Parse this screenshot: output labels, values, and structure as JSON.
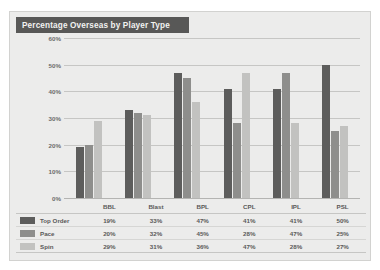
{
  "chart_data": {
    "type": "bar",
    "title": "Percentage Overseas by Player Type",
    "categories": [
      "BBL",
      "Blast",
      "BPL",
      "CPL",
      "IPL",
      "PSL"
    ],
    "series": [
      {
        "name": "Top Order",
        "values": [
          19,
          33,
          47,
          41,
          41,
          50
        ],
        "color": "#5d5d5c",
        "labels": [
          "19%",
          "33%",
          "47%",
          "41%",
          "41%",
          "50%"
        ]
      },
      {
        "name": "Pace",
        "values": [
          20,
          32,
          45,
          28,
          47,
          25
        ],
        "color": "#8e8e8c",
        "labels": [
          "20%",
          "32%",
          "45%",
          "28%",
          "47%",
          "25%"
        ]
      },
      {
        "name": "Spin",
        "values": [
          29,
          31,
          36,
          47,
          28,
          27
        ],
        "color": "#c2c2c0",
        "labels": [
          "29%",
          "31%",
          "36%",
          "47%",
          "28%",
          "27%"
        ]
      }
    ],
    "xlabel": "",
    "ylabel": "",
    "ylim": [
      0,
      60
    ],
    "yticks": [
      "0%",
      "10%",
      "20%",
      "30%",
      "40%",
      "50%",
      "60%"
    ],
    "ytick_values": [
      0,
      10,
      20,
      30,
      40,
      50,
      60
    ],
    "grid": "horizontal",
    "legend_position": "bottom-table",
    "has_data_table": true
  },
  "panel": {
    "background": "#ececeb",
    "title_bar_color": "#585857",
    "title_text_color": "#f2f2f1"
  }
}
